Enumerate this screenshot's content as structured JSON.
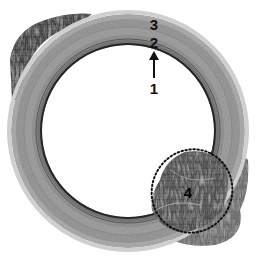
{
  "figure": {
    "type": "histology-cross-section",
    "colors": {
      "background": "#ffffff",
      "wall_outer": "#a9a9a9",
      "wall_mid": "#8e8e8e",
      "wall_inner_line": "#2a2a2a",
      "dark_tissue": "#3c3c3c",
      "annotation": "#111111"
    },
    "ring": {
      "cx": 128,
      "cy": 131,
      "outer_r": 117,
      "inner_r": 86
    },
    "region_ellipse": {
      "cx": 192,
      "cy": 191,
      "rx": 40,
      "ry": 42,
      "style": "dotted"
    }
  },
  "annotations": {
    "label_3": "3",
    "label_2": "2",
    "label_1": "1",
    "label_4": "4",
    "arrow": "arrow-up"
  }
}
